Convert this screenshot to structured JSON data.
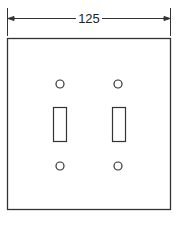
{
  "diagram": {
    "dimension": {
      "label": "125",
      "orientation": "horizontal",
      "spans": "plate width"
    },
    "plate": {
      "shape": "square",
      "stroke_color": "#333333",
      "fill_color": "#ffffff"
    },
    "switch_openings": [
      {
        "name": "left-toggle-opening"
      },
      {
        "name": "right-toggle-opening"
      }
    ],
    "screw_holes": [
      {
        "name": "top-left-screw-hole"
      },
      {
        "name": "top-right-screw-hole"
      },
      {
        "name": "bottom-left-screw-hole"
      },
      {
        "name": "bottom-right-screw-hole"
      }
    ]
  }
}
